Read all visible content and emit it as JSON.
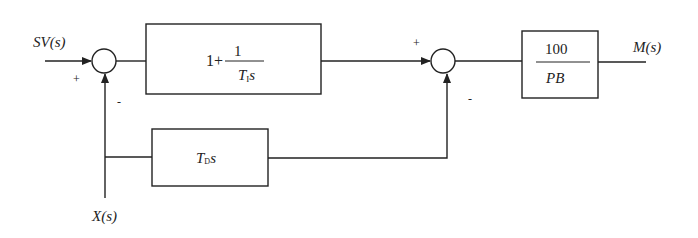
{
  "inputs": {
    "setpoint": "SV(s)",
    "measurement": "X(s)"
  },
  "output": "M(s)",
  "summing_junctions": [
    {
      "id": "sum1",
      "signs": {
        "left": "+",
        "bottom": "-"
      }
    },
    {
      "id": "sum2",
      "signs": {
        "left": "+",
        "bottom": "-"
      }
    }
  ],
  "blocks": {
    "integral": {
      "prefix": "1+",
      "numerator": "1",
      "den_var": "T",
      "den_sub": "I",
      "den_s": "s"
    },
    "derivative": {
      "var": "T",
      "sub": "D",
      "s": "s"
    },
    "gain": {
      "numerator": "100",
      "denominator": "PB"
    }
  },
  "colors": {
    "line": "#222222",
    "background": "#ffffff"
  }
}
